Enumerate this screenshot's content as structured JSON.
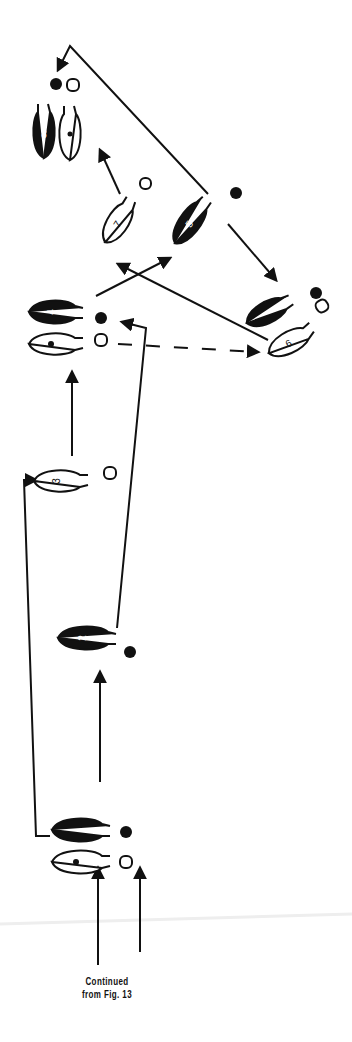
{
  "figure": {
    "caption_line1": "Continued",
    "caption_line2": "from Fig. 13"
  },
  "colors": {
    "ink": "#111111",
    "paper": "#ffffff"
  },
  "steps": [
    {
      "label": "1",
      "foot": "dark",
      "x": 88,
      "y": 830,
      "rot": 0
    },
    {
      "label": "&",
      "foot": "light",
      "x": 88,
      "y": 862,
      "rot": 0
    },
    {
      "label": "2",
      "foot": "dark",
      "x": 88,
      "y": 638,
      "rot": 0
    },
    {
      "label": "3",
      "foot": "light",
      "x": 60,
      "y": 480,
      "rot": 0
    },
    {
      "label": "4",
      "foot": "dark",
      "x": 55,
      "y": 312,
      "rot": 0
    },
    {
      "label": "&",
      "foot": "light",
      "x": 55,
      "y": 345,
      "rot": 0
    },
    {
      "label": "5",
      "foot": "dark",
      "x": 200,
      "y": 218,
      "rot": -60
    },
    {
      "label": "&",
      "foot": "dark",
      "x": 272,
      "y": 310,
      "rot": -30
    },
    {
      "label": "6",
      "foot": "light",
      "x": 290,
      "y": 340,
      "rot": -30
    },
    {
      "label": "7",
      "foot": "light",
      "x": 120,
      "y": 223,
      "rot": -60
    },
    {
      "label": "8",
      "foot": "dark",
      "x": 42,
      "y": 131,
      "rot": 90
    },
    {
      "label": "&",
      "foot": "light",
      "x": 68,
      "y": 134,
      "rot": 90
    }
  ]
}
